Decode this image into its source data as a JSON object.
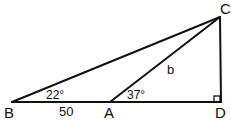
{
  "diagram": {
    "type": "geometry-triangles",
    "points": {
      "B": {
        "label": "B",
        "x": 12,
        "y": 102
      },
      "A": {
        "label": "A",
        "x": 110,
        "y": 102
      },
      "D": {
        "label": "D",
        "x": 221,
        "y": 102
      },
      "C": {
        "label": "C",
        "x": 220,
        "y": 17
      }
    },
    "segments": [
      {
        "from": "B",
        "to": "D"
      },
      {
        "from": "B",
        "to": "C"
      },
      {
        "from": "A",
        "to": "C"
      },
      {
        "from": "C",
        "to": "D"
      }
    ],
    "labels": {
      "angle_B": "22°",
      "angle_A": "37°",
      "side_BA": "50",
      "side_AC": "b"
    },
    "right_angle_at": "D",
    "stroke_color": "#111111"
  }
}
